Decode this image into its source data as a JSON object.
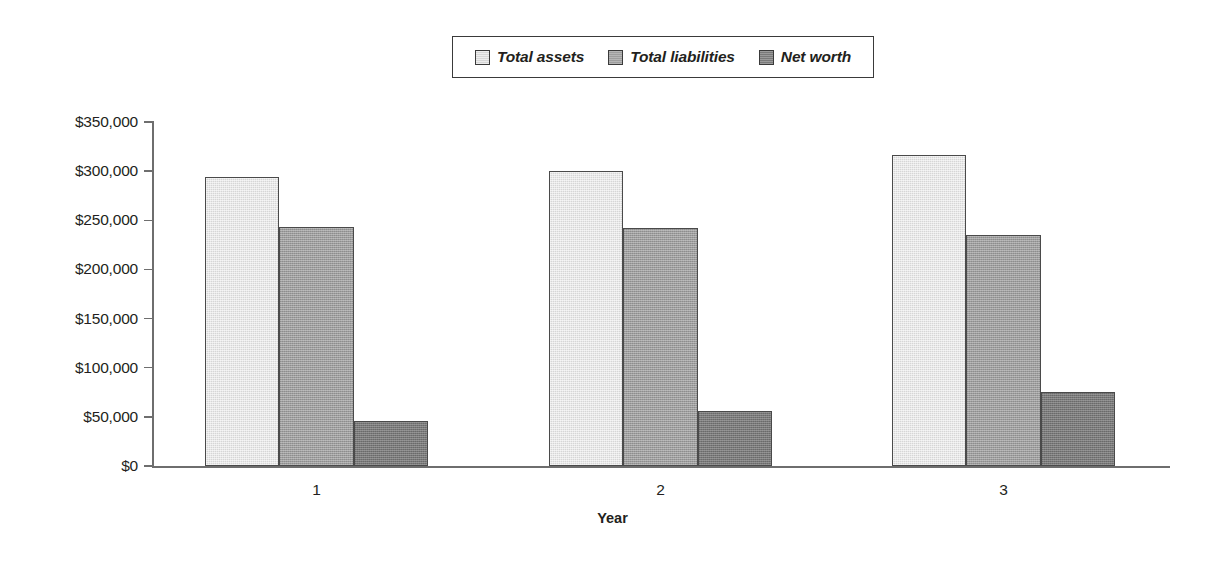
{
  "chart_data": {
    "type": "bar",
    "title": "",
    "subtitle": "",
    "xlabel": "Year",
    "ylabel": "",
    "categories": [
      "1",
      "2",
      "3"
    ],
    "series": [
      {
        "name": "Total assets",
        "values": [
          294000,
          300000,
          316000
        ],
        "color": "#d6d6d6"
      },
      {
        "name": "Total liabilities",
        "values": [
          243000,
          242000,
          235000
        ],
        "color": "#9d9d9d"
      },
      {
        "name": "Net worth",
        "values": [
          46000,
          56000,
          75000
        ],
        "color": "#797979"
      }
    ],
    "ylim": [
      0,
      350000
    ],
    "ytick_values": [
      0,
      50000,
      100000,
      150000,
      200000,
      250000,
      300000,
      350000
    ],
    "ytick_labels": [
      "$0",
      "$50,000",
      "$100,000",
      "$150,000",
      "$200,000",
      "$250,000",
      "$300,000",
      "$350,000"
    ],
    "xtick_labels": [
      "1",
      "2",
      "3"
    ],
    "grid": false,
    "legend_position": "top-center",
    "value_prefix": "$"
  },
  "legend": {
    "entries": [
      {
        "label": "Total assets"
      },
      {
        "label": "Total liabilities"
      },
      {
        "label": "Net worth"
      }
    ]
  },
  "axes": {
    "x_title": "Year"
  }
}
